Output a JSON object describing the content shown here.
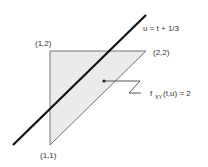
{
  "diagram": {
    "line_label": "u = t + 1/3",
    "vertices": [
      {
        "label": "(1,2)"
      },
      {
        "label": "(2,2)"
      },
      {
        "label": "(1,1)"
      }
    ],
    "density_label_prefix": "f",
    "density_label_sub": "XY",
    "density_label_suffix": "(t,u) = 2",
    "colors": {
      "region_fill": "#ebebeb",
      "region_stroke": "#777777",
      "line": "#111111"
    }
  }
}
